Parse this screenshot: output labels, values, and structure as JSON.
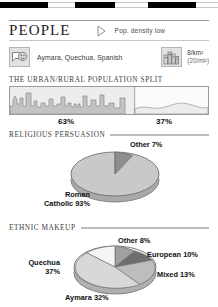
{
  "topbar": {
    "segments": [
      {
        "kind": "black",
        "width": 48
      },
      {
        "kind": "white",
        "width": 27
      },
      {
        "kind": "black",
        "width": 40
      },
      {
        "kind": "white",
        "width": 33
      },
      {
        "kind": "black",
        "width": 48
      },
      {
        "kind": "white",
        "width": 22
      }
    ]
  },
  "header": {
    "title": "PEOPLE",
    "marker_icon": "play-triangle-icon",
    "pop_density_note": "Pop. density low"
  },
  "facts": {
    "language_icon": "speech-face-icon",
    "languages": "Aymara, Quechua, Spanish",
    "density_icon": "city-buildings-icon",
    "density_metric": "8/km²",
    "density_imperial": "(20/mi²)"
  },
  "urban_rural": {
    "heading": "THE URBAN/RURAL POPULATION SPLIT",
    "urban_label": "63%",
    "rural_label": "37%",
    "urban_pct": 63,
    "rural_pct": 37
  },
  "religion": {
    "heading": "RELIGIOUS PERSUASION"
  },
  "ethnic": {
    "heading": "ETHNIC MAKEUP"
  },
  "chart_data": [
    {
      "type": "pie",
      "title": "RELIGIOUS PERSUASION",
      "labels": [
        "Roman Catholic 93%",
        "Other 7%"
      ],
      "categories": [
        "Roman Catholic",
        "Other"
      ],
      "values": [
        93,
        7
      ],
      "colors": [
        "#c8c8c8",
        "#8e8e8e"
      ],
      "legend": "labels-outside",
      "three_d": true
    },
    {
      "type": "pie",
      "title": "ETHNIC MAKEUP",
      "labels": [
        "Quechua 37%",
        "Aymara 32%",
        "Mixed 13%",
        "European 10%",
        "Other 8%"
      ],
      "categories": [
        "Quechua",
        "Aymara",
        "Mixed",
        "European",
        "Other"
      ],
      "values": [
        37,
        32,
        13,
        10,
        8
      ],
      "colors": [
        "#f1f1f1",
        "#d8d8d8",
        "#bdbdbd",
        "#6e6e6e",
        "#a0a0a0"
      ],
      "legend": "labels-outside",
      "three_d": true
    }
  ]
}
